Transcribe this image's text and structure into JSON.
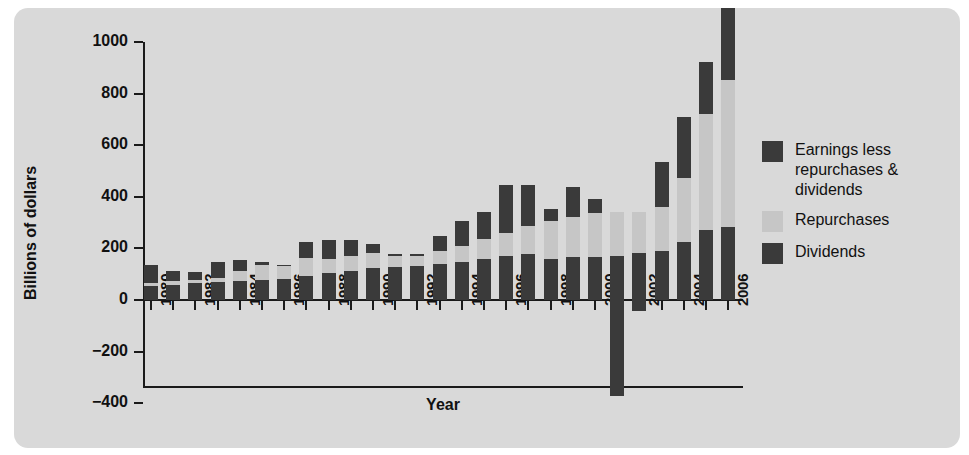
{
  "chart_data": {
    "type": "bar",
    "stacked": true,
    "title": "",
    "xlabel": "Year",
    "ylabel": "Billions of dollars",
    "ylim": [
      -400,
      1000
    ],
    "ytick_labels": [
      "1000",
      "800",
      "600",
      "400",
      "200",
      "0",
      "−200",
      "−400"
    ],
    "ytick_values": [
      1000,
      800,
      600,
      400,
      200,
      0,
      -200,
      -400
    ],
    "grid": false,
    "legend_position": "right",
    "categories": [
      "1980",
      "1981",
      "1982",
      "1983",
      "1984",
      "1985",
      "1986",
      "1987",
      "1988",
      "1989",
      "1990",
      "1991",
      "1992",
      "1993",
      "1994",
      "1995",
      "1996",
      "1997",
      "1998",
      "1999",
      "2000",
      "2001",
      "2002",
      "2003",
      "2004",
      "2005",
      "2006"
    ],
    "xtick_labels": [
      "1980",
      "",
      "1982",
      "",
      "1984",
      "",
      "1986",
      "",
      "1988",
      "",
      "1990",
      "",
      "1992",
      "",
      "1994",
      "",
      "1996",
      "",
      "1998",
      "",
      "2000",
      "",
      "2002",
      "",
      "2004",
      "",
      "2006"
    ],
    "series": [
      {
        "name": "Dividends",
        "color": "#3a3a3a",
        "values": [
          55,
          60,
          65,
          68,
          72,
          78,
          82,
          92,
          105,
          112,
          125,
          128,
          132,
          140,
          148,
          160,
          172,
          178,
          158,
          165,
          168,
          170,
          182,
          190,
          225,
          272,
          282
        ]
      },
      {
        "name": "Repurchases",
        "color": "#c6c6c6",
        "values": [
          10,
          12,
          14,
          18,
          40,
          58,
          50,
          72,
          55,
          60,
          58,
          42,
          38,
          48,
          62,
          75,
          88,
          110,
          148,
          158,
          170,
          172,
          158,
          172,
          248,
          450,
          572
        ]
      },
      {
        "name": "Earnings less repurchases & dividends",
        "color": "#3a3a3a",
        "values": [
          70,
          42,
          28,
          62,
          42,
          10,
          5,
          62,
          72,
          62,
          35,
          8,
          10,
          62,
          96,
          108,
          185,
          158,
          48,
          115,
          52,
          -372,
          -42,
          172,
          235,
          200,
          278
        ]
      }
    ],
    "legend": [
      {
        "label": "Earnings less repurchases & dividends",
        "color": "#3a3a3a"
      },
      {
        "label": "Repurchases",
        "color": "#c6c6c6"
      },
      {
        "label": "Dividends",
        "color": "#3a3a3a"
      }
    ]
  },
  "legend": {
    "earnings_label": "Earnings less repurchases & dividends",
    "repurchases_label": "Repurchases",
    "dividends_label": "Dividends"
  },
  "axes": {
    "ylabel": "Billions of dollars",
    "xlabel": "Year"
  }
}
